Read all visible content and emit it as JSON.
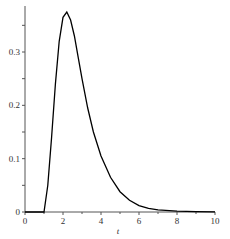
{
  "chart_data": {
    "type": "line",
    "title": "",
    "xlabel": "t",
    "ylabel": "",
    "xlim": [
      0,
      10
    ],
    "ylim": [
      0,
      0.375
    ],
    "grid": false,
    "x_ticks": [
      "0",
      "2",
      "4",
      "6",
      "8",
      "10"
    ],
    "y_ticks": [
      "0",
      "0.1",
      "0.2",
      "0.3"
    ],
    "series": [
      {
        "name": "f(t)",
        "x": [
          0,
          0.5,
          1.0,
          1.2,
          1.4,
          1.6,
          1.8,
          2.0,
          2.2,
          2.4,
          2.6,
          2.8,
          3.0,
          3.3,
          3.6,
          4.0,
          4.5,
          5.0,
          5.5,
          6.0,
          6.5,
          7.0,
          8.0,
          9.0,
          10.0
        ],
        "y": [
          0,
          0,
          0,
          0.05,
          0.14,
          0.24,
          0.32,
          0.365,
          0.375,
          0.36,
          0.33,
          0.29,
          0.25,
          0.195,
          0.15,
          0.105,
          0.065,
          0.038,
          0.022,
          0.012,
          0.007,
          0.004,
          0.0015,
          0.0005,
          0.0002
        ]
      }
    ]
  }
}
